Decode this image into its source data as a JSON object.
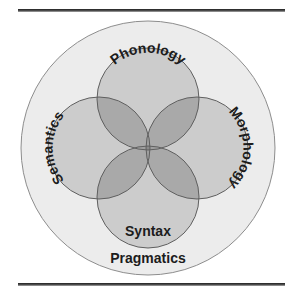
{
  "figure": {
    "canvas": {
      "width": 297,
      "height": 297,
      "background": "#ffffff"
    },
    "rules": {
      "top_label": "top-horizontal-rule",
      "bottom_label": "bottom-horizontal-rule",
      "color": "#4a4a4a"
    }
  },
  "diagram": {
    "type": "venn",
    "center": {
      "x": 148,
      "y": 148
    },
    "outer": {
      "label": "Pragmatics",
      "radius": 127,
      "fill": "#ececec",
      "stroke": "#8d8d8d",
      "label_position": "bottom-inside"
    },
    "circles": [
      {
        "label": "Phonology",
        "position": "top",
        "cx": 148,
        "cy": 99,
        "r": 51,
        "fill": "#c9c9c9",
        "stroke": "#6f6f6f",
        "text_style": "curved-arc"
      },
      {
        "label": "Morphology",
        "position": "right",
        "cx": 197,
        "cy": 148,
        "r": 51,
        "fill": "#c9c9c9",
        "stroke": "#6f6f6f",
        "text_style": "curved-arc-rotated-cw"
      },
      {
        "label": "Syntax",
        "position": "bottom",
        "cx": 148,
        "cy": 197,
        "r": 51,
        "fill": "#c9c9c9",
        "stroke": "#6f6f6f",
        "text_style": "horizontal"
      },
      {
        "label": "Semantics",
        "position": "left",
        "cx": 99,
        "cy": 148,
        "r": 51,
        "fill": "#c9c9c9",
        "stroke": "#6f6f6f",
        "text_style": "curved-arc-rotated-ccw"
      }
    ],
    "overlap_shades": {
      "two_way": "#adadad",
      "three_way": "#9a9a9a",
      "four_way_center": "#8b8b8b"
    }
  },
  "labels": {
    "pragmatics": "Pragmatics",
    "phonology": "Phonology",
    "morphology": "Morphology",
    "syntax": "Syntax",
    "semantics": "Semantics"
  }
}
